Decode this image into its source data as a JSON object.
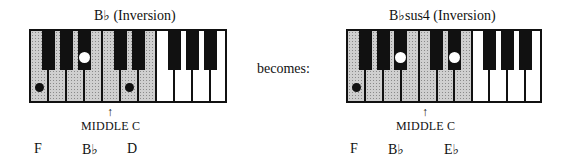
{
  "left": {
    "title": "B♭ (Inversion)",
    "middle_c_arrow": "↑",
    "middle_c_label": "MIDDLE C",
    "notes": [
      "F",
      "B♭",
      "D"
    ]
  },
  "connector": "becomes:",
  "right": {
    "title": "B♭sus4 (Inversion)",
    "middle_c_arrow": "↑",
    "middle_c_label": "MIDDLE C",
    "notes": [
      "F",
      "B♭",
      "E♭"
    ]
  },
  "colors": {
    "shade": "#cfcfcf",
    "key_black": "#111111",
    "key_white": "#ffffff"
  }
}
